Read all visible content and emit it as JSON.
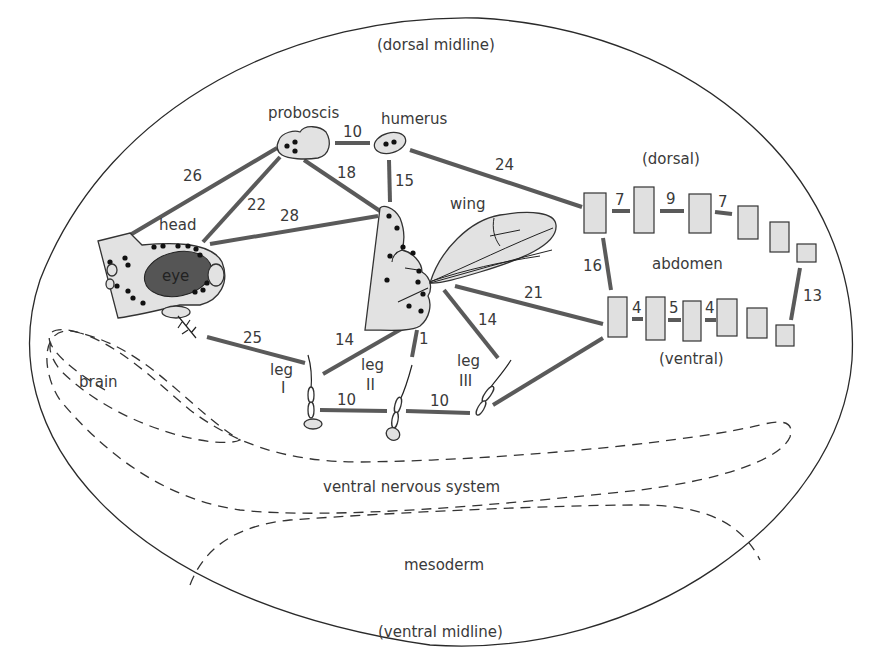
{
  "labels": {
    "dorsal_midline": "(dorsal midline)",
    "ventral_midline": "(ventral midline)",
    "proboscis": "proboscis",
    "humerus": "humerus",
    "head": "head",
    "eye": "eye",
    "wing": "wing",
    "leg1_a": "leg",
    "leg1_b": "I",
    "leg2_a": "leg",
    "leg2_b": "II",
    "leg3_a": "leg",
    "leg3_b": "III",
    "abdomen": "abdomen",
    "abdomen_dorsal": "(dorsal)",
    "abdomen_ventral": "(ventral)",
    "brain": "brain",
    "ventral_nervous_system": "ventral nervous system",
    "mesoderm": "mesoderm"
  },
  "distances": {
    "head_proboscis": "26",
    "head_proboscis_inner": "22",
    "head_wing": "28",
    "proboscis_humerus": "10",
    "proboscis_wing": "18",
    "humerus_wing": "15",
    "humerus_abdomen": "24",
    "abdomen_dorsal_1": "7",
    "abdomen_dorsal_2": "9",
    "abdomen_dorsal_3": "7",
    "abdomen_dv": "16",
    "abdomen_ventral_1": "4",
    "abdomen_ventral_2": "5",
    "abdomen_ventral_3": "4",
    "abdomen_posterior": "13",
    "wing_abdomen": "21",
    "wing_leg3": "14",
    "wing_leg1": "14",
    "wing_leg2": "1",
    "head_leg1": "25",
    "leg1_leg2": "10",
    "leg2_leg3": "10"
  },
  "colors": {
    "link": "#5a5a5a",
    "disc_fill": "#e2e2e2",
    "eye_fill": "#555555",
    "outline": "#2a2a2a"
  }
}
